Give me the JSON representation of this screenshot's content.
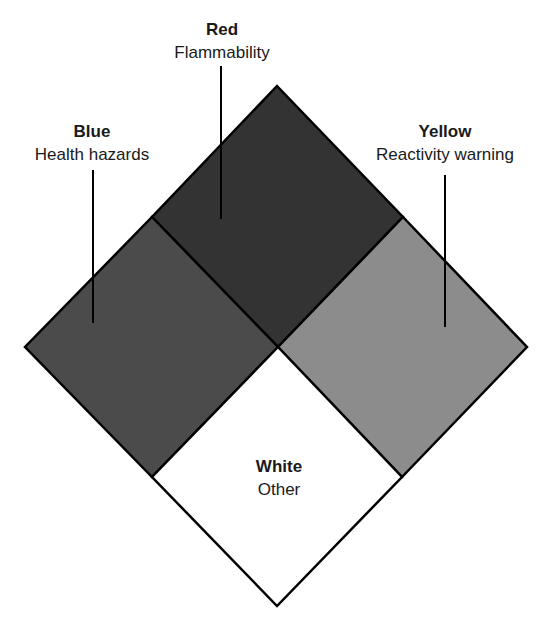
{
  "diagram": {
    "type": "hazard-diamond",
    "sections": {
      "top": {
        "title": "Red",
        "description": "Flammability",
        "fill": "#333333"
      },
      "left": {
        "title": "Blue",
        "description": "Health hazards",
        "fill": "#4b4b4b"
      },
      "right": {
        "title": "Yellow",
        "description": "Reactivity warning",
        "fill": "#8c8c8c"
      },
      "bottom": {
        "title": "White",
        "description": "Other",
        "fill": "#ffffff"
      }
    },
    "outline_color": "#000000"
  }
}
